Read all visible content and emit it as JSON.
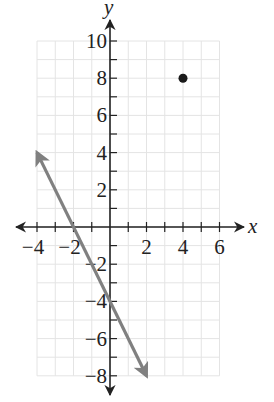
{
  "chart_data": {
    "type": "line",
    "title": "",
    "xlabel": "x",
    "ylabel": "y",
    "xlim": [
      -4,
      6
    ],
    "ylim": [
      -8,
      10
    ],
    "grid": true,
    "grid_step": 1,
    "x_ticks": [
      -4,
      -2,
      2,
      4,
      6
    ],
    "y_ticks": [
      10,
      8,
      6,
      4,
      2,
      -2,
      -4,
      -6,
      -8
    ],
    "series": [
      {
        "name": "line",
        "kind": "ray-line",
        "equation": "y = -2x - 4",
        "points": [
          {
            "x": -4,
            "y": 4
          },
          {
            "x": 2,
            "y": -8
          }
        ],
        "color": "#808080",
        "arrows_both_ends": true
      },
      {
        "name": "point",
        "kind": "scatter",
        "points": [
          {
            "x": 4,
            "y": 8
          }
        ],
        "color": "#1a1a1a"
      }
    ]
  },
  "labels": {
    "x_axis": "x",
    "y_axis": "y",
    "x_tick_labels": [
      "−4",
      "−2",
      "2",
      "4",
      "6"
    ],
    "y_tick_labels": [
      "10",
      "8",
      "6",
      "4",
      "2",
      "−2",
      "−4",
      "−6",
      "−8"
    ]
  },
  "colors": {
    "grid": "#e4e4e4",
    "axis": "#222222",
    "line": "#808080",
    "point": "#1a1a1a"
  }
}
